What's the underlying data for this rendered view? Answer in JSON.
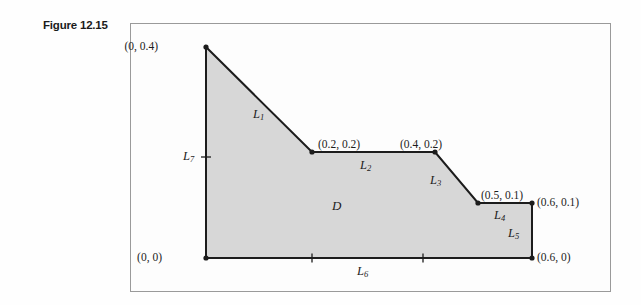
{
  "figure": {
    "caption": "Figure 12.15",
    "region_label": "D",
    "frame": {
      "x": 130,
      "y": 23,
      "width": 481,
      "height": 269
    },
    "colors": {
      "region_fill": "#d7d7d7",
      "outline": "#1c1c1c",
      "frame_border": "#9a9a9a",
      "background": "#fdfdfd",
      "text": "#1c1c1c"
    }
  },
  "chart_data": {
    "type": "diagram",
    "title": "Figure 12.15",
    "xlabel": "",
    "ylabel": "",
    "xlim": [
      0,
      0.6
    ],
    "ylim": [
      0,
      0.4
    ],
    "grid": false,
    "legend": "none",
    "region_name": "D",
    "vertices": [
      {
        "name": "(0, 0.4)",
        "x": 0.0,
        "y": 0.4,
        "px": 206,
        "py": 47
      },
      {
        "name": "(0.2, 0.2)",
        "x": 0.2,
        "y": 0.2,
        "px": 312,
        "py": 152
      },
      {
        "name": "(0.4, 0.2)",
        "x": 0.4,
        "y": 0.2,
        "px": 435,
        "py": 152
      },
      {
        "name": "(0.5, 0.1)",
        "x": 0.5,
        "y": 0.1,
        "px": 478,
        "py": 203
      },
      {
        "name": "(0.6, 0.1)",
        "x": 0.6,
        "y": 0.1,
        "px": 532,
        "py": 203
      },
      {
        "name": "(0.6, 0)",
        "x": 0.6,
        "y": 0.0,
        "px": 532,
        "py": 258
      },
      {
        "name": "(0, 0)",
        "x": 0.0,
        "y": 0.0,
        "px": 206,
        "py": 258
      }
    ],
    "segments": [
      {
        "label": "L",
        "sub": "1",
        "from": "(0, 0.4)",
        "to": "(0.2, 0.2)"
      },
      {
        "label": "L",
        "sub": "2",
        "from": "(0.2, 0.2)",
        "to": "(0.4, 0.2)"
      },
      {
        "label": "L",
        "sub": "3",
        "from": "(0.4, 0.2)",
        "to": "(0.5, 0.1)"
      },
      {
        "label": "L",
        "sub": "4",
        "from": "(0.5, 0.1)",
        "to": "(0.6, 0.1)"
      },
      {
        "label": "L",
        "sub": "5",
        "from": "(0.6, 0.1)",
        "to": "(0.6, 0)"
      },
      {
        "label": "L",
        "sub": "6",
        "from": "(0.6, 0)",
        "to": "(0, 0)"
      },
      {
        "label": "L",
        "sub": "7",
        "from": "(0, 0)",
        "to": "(0, 0.4)"
      }
    ],
    "tick_marks": [
      {
        "on": "L7",
        "px": 206,
        "py": 157,
        "orientation": "horizontal"
      },
      {
        "on": "L6",
        "px": 312,
        "py": 258,
        "orientation": "vertical"
      },
      {
        "on": "L6",
        "px": 423,
        "py": 258,
        "orientation": "vertical"
      }
    ]
  },
  "labels": {
    "vertices": [
      {
        "id": "v-0-04",
        "text": "(0, 0.4)",
        "left": 158,
        "top": 41,
        "anchor": "right"
      },
      {
        "id": "v-02-02",
        "text": "(0.2, 0.2)",
        "left": 318,
        "top": 139,
        "anchor": "left"
      },
      {
        "id": "v-04-02",
        "text": "(0.4, 0.2)",
        "left": 400,
        "top": 139,
        "anchor": "left"
      },
      {
        "id": "v-05-01",
        "text": "(0.5, 0.1)",
        "left": 481,
        "top": 190,
        "anchor": "left"
      },
      {
        "id": "v-06-01",
        "text": "(0.6, 0.1)",
        "left": 537,
        "top": 197,
        "anchor": "left"
      },
      {
        "id": "v-06-0",
        "text": "(0.6, 0)",
        "left": 537,
        "top": 252,
        "anchor": "left"
      },
      {
        "id": "v-0-0",
        "text": "(0, 0)",
        "left": 162,
        "top": 252,
        "anchor": "right"
      }
    ],
    "segments": [
      {
        "id": "seg-L1",
        "base": "L",
        "sub": "1",
        "left": 253,
        "top": 108
      },
      {
        "id": "seg-L2",
        "base": "L",
        "sub": "2",
        "left": 360,
        "top": 159
      },
      {
        "id": "seg-L3",
        "base": "L",
        "sub": "3",
        "left": 430,
        "top": 174
      },
      {
        "id": "seg-L4",
        "base": "L",
        "sub": "4",
        "left": 494,
        "top": 209
      },
      {
        "id": "seg-L5",
        "base": "L",
        "sub": "5",
        "left": 508,
        "top": 227
      },
      {
        "id": "seg-L6",
        "base": "L",
        "sub": "6",
        "left": 357,
        "top": 265
      },
      {
        "id": "seg-L7",
        "base": "L",
        "sub": "7",
        "left": 183,
        "top": 150
      }
    ],
    "region": {
      "text": "D",
      "left": 332,
      "top": 198
    }
  }
}
